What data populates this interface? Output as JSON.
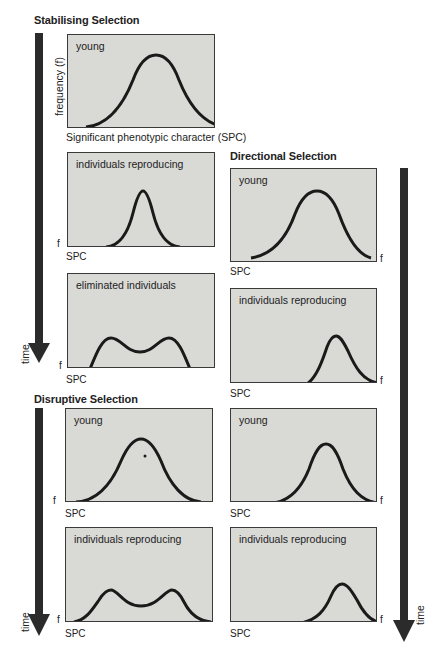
{
  "sections": {
    "stabilising": {
      "title": "Stabilising Selection"
    },
    "directional": {
      "title": "Directional Selection"
    },
    "disruptive": {
      "title": "Disruptive Selection"
    }
  },
  "axes": {
    "y_full": "frequency (f)",
    "x_full": "Significant phenotypic character (SPC)",
    "y_short": "f",
    "x_short": "SPC",
    "time": "time"
  },
  "panels": {
    "stab_young": {
      "label": "young",
      "curve": "single peak, centered, broad"
    },
    "stab_reproducing": {
      "label": "individuals reproducing",
      "curve": "single peak, centered, narrow"
    },
    "stab_eliminated": {
      "label": "eliminated individuals",
      "curve": "two low peaks at both extremes"
    },
    "dir_young": {
      "label": "young",
      "curve": "single peak, centered, broad"
    },
    "dir_reproducing": {
      "label": "individuals reproducing",
      "curve": "single peak shifted right"
    },
    "dis_young": {
      "label": "young",
      "curve": "single peak, centered, broad"
    },
    "dis_reproducing": {
      "label": "individuals reproducing",
      "curve": "two peaks, bimodal"
    },
    "dir2_young": {
      "label": "young",
      "curve": "single peak slightly right of center"
    },
    "dir2_reproducing": {
      "label": "individuals reproducing",
      "curve": "single peak shifted far right"
    }
  },
  "colors": {
    "panel_fill": "#d9d9d6",
    "curve": "#1a1a1a",
    "arrow": "#2b2b2b"
  }
}
